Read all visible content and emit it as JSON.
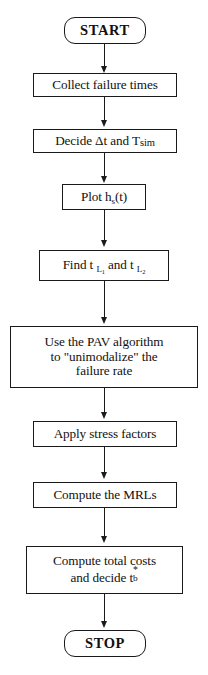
{
  "diagram": {
    "orientation": "top-to-bottom",
    "colors": {
      "background": "#ffffff",
      "stroke": "#1a1a1a",
      "text": "#111111"
    },
    "nodes": [
      {
        "id": "start",
        "shape": "rounded-rectangle",
        "label": "START",
        "bold": true
      },
      {
        "id": "collect-failure-times",
        "shape": "rectangle",
        "label": "Collect failure times"
      },
      {
        "id": "decide-dt-tsim",
        "shape": "rectangle",
        "label": "Decide Δt and Tsim",
        "label_parts": [
          "Decide ",
          "Δt",
          " and T",
          "sim"
        ]
      },
      {
        "id": "plot-hs-t",
        "shape": "rectangle",
        "label": "Plot h s(t)",
        "label_parts": [
          "Plot h",
          "s",
          "(t)"
        ]
      },
      {
        "id": "find-tl1-tl2",
        "shape": "rectangle",
        "label": "Find t L1 and t L2",
        "label_parts": [
          "Find  t ",
          "L",
          "1",
          " and t ",
          "L",
          "2"
        ]
      },
      {
        "id": "pav-algorithm",
        "shape": "rectangle",
        "label": "Use the PAV algorithm to \"unimodalize\" the failure rate",
        "lines": [
          "Use the PAV algorithm",
          "to \"unimodalize\" the",
          "failure rate"
        ]
      },
      {
        "id": "apply-stress-factors",
        "shape": "rectangle",
        "label": "Apply stress factors"
      },
      {
        "id": "compute-mrls",
        "shape": "rectangle",
        "label": "Compute the MRLs"
      },
      {
        "id": "compute-total-costs",
        "shape": "rectangle",
        "label": "Compute total costs and decide t b*",
        "lines": [
          "Compute total costs",
          "and decide t b*"
        ]
      },
      {
        "id": "stop",
        "shape": "rounded-rectangle",
        "label": "STOP",
        "bold": true
      }
    ],
    "edges": [
      {
        "from": "start",
        "to": "collect-failure-times",
        "arrow": "down"
      },
      {
        "from": "collect-failure-times",
        "to": "decide-dt-tsim",
        "arrow": "down"
      },
      {
        "from": "decide-dt-tsim",
        "to": "plot-hs-t",
        "arrow": "down"
      },
      {
        "from": "plot-hs-t",
        "to": "find-tl1-tl2",
        "arrow": "down"
      },
      {
        "from": "find-tl1-tl2",
        "to": "pav-algorithm",
        "arrow": "down"
      },
      {
        "from": "pav-algorithm",
        "to": "apply-stress-factors",
        "arrow": "down"
      },
      {
        "from": "apply-stress-factors",
        "to": "compute-mrls",
        "arrow": "down"
      },
      {
        "from": "compute-mrls",
        "to": "compute-total-costs",
        "arrow": "down"
      },
      {
        "from": "compute-total-costs",
        "to": "stop",
        "arrow": "down"
      }
    ]
  },
  "labels": {
    "start": "START",
    "collect": "Collect failure times",
    "decide_prefix": "Decide ",
    "decide_delta": "Δt",
    "decide_mid": " and T",
    "decide_sub": "sim",
    "plot_prefix": "Plot h",
    "plot_sub": "s",
    "plot_suffix": "(t)",
    "find_prefix": "Find  t ",
    "find_sub1_main": "L",
    "find_sub1_num": "1",
    "find_mid": " and t ",
    "find_sub2_main": "L",
    "find_sub2_num": "2",
    "pav_line1": "Use the PAV algorithm",
    "pav_line2": "to \"unimodalize\" the",
    "pav_line3": "failure rate",
    "apply": "Apply stress factors",
    "mrls": "Compute the MRLs",
    "costs_line1": "Compute total costs",
    "costs_line2_prefix": "and decide t",
    "costs_sub": "b",
    "costs_sup": "*",
    "stop": "STOP"
  }
}
